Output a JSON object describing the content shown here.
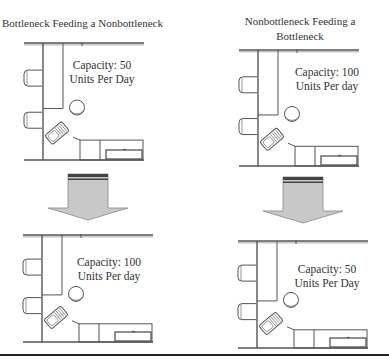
{
  "panels": {
    "top_left": {
      "title": "Bottleneck Feeding a Nonbottleneck",
      "capacity_line1": "Capacity: 50",
      "capacity_line2": "Units Per Day"
    },
    "top_right": {
      "title_line1": "Nonbottleneck Feeding a",
      "title_line2": "Bottleneck",
      "capacity_line1": "Capacity: 100",
      "capacity_line2": "Units Per day"
    },
    "bottom_left": {
      "capacity_line1": "Capacity: 100",
      "capacity_line2": "Units Per day"
    },
    "bottom_right": {
      "capacity_line1": "Capacity: 50",
      "capacity_line2": "Units Per Day"
    }
  },
  "arrows": [
    {
      "direction": "down",
      "from": "top_left",
      "to": "bottom_left"
    },
    {
      "direction": "down",
      "from": "top_right",
      "to": "bottom_right"
    }
  ],
  "colors": {
    "line": "#555555",
    "arrow_fill": "#c8c8c8",
    "arrow_band": "#444444",
    "rule": "#222222"
  }
}
